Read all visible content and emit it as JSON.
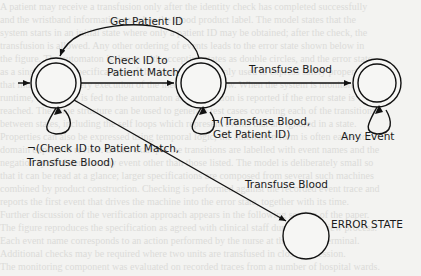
{
  "diagram": {
    "type": "state-machine",
    "states": [
      {
        "id": "s1",
        "label": "",
        "accepting": true,
        "initial": true
      },
      {
        "id": "s2",
        "label": "",
        "accepting": true
      },
      {
        "id": "s3",
        "label": "",
        "accepting": true
      },
      {
        "id": "error",
        "label": "ERROR STATE",
        "accepting": false
      }
    ],
    "transitions": [
      {
        "from": "s2",
        "to": "s1",
        "label": "Get Patient ID"
      },
      {
        "from": "s1",
        "to": "s2",
        "label_line1": "Check ID to",
        "label_line2": "Patient Match"
      },
      {
        "from": "s2",
        "to": "s3",
        "label": "Transfuse Blood"
      },
      {
        "from": "s1",
        "to": "s1",
        "label_line1": "¬(Check ID to Patient Match,",
        "label_line2": "Transfuse Blood)"
      },
      {
        "from": "s2",
        "to": "s2",
        "label_line1": "¬(Transfuse Blood,",
        "label_line2": "Get Patient ID)"
      },
      {
        "from": "s3",
        "to": "s3",
        "label": "Any Event"
      },
      {
        "from": "s1",
        "to": "error",
        "label": "Transfuse Blood"
      }
    ]
  }
}
